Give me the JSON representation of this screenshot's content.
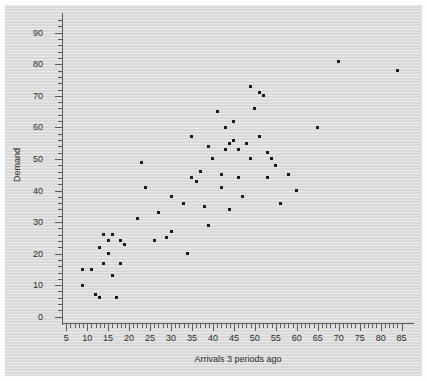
{
  "chart_data": {
    "type": "scatter",
    "title": "",
    "xlabel": "Arrivals 3 periods ago",
    "ylabel": "Demand",
    "xlim": [
      4,
      87
    ],
    "ylim": [
      -2,
      95
    ],
    "xticks": [
      5,
      10,
      15,
      20,
      25,
      30,
      35,
      40,
      45,
      50,
      55,
      60,
      65,
      70,
      75,
      80,
      85
    ],
    "yticks": [
      0,
      10,
      20,
      30,
      40,
      50,
      60,
      70,
      80,
      90
    ],
    "x_minor_tick_step": 1,
    "y_minor_tick_step": 2,
    "grid": false,
    "legend": null,
    "marker": "square",
    "marker_color": "#1a1a1a",
    "marker_size_px": 3,
    "background_color": "#d9d9d9",
    "axis_color": "#5a5a5a",
    "points": [
      {
        "x": 9,
        "y": 15
      },
      {
        "x": 9,
        "y": 10
      },
      {
        "x": 11,
        "y": 15
      },
      {
        "x": 12,
        "y": 7
      },
      {
        "x": 13,
        "y": 6
      },
      {
        "x": 13,
        "y": 22
      },
      {
        "x": 14,
        "y": 17
      },
      {
        "x": 14,
        "y": 26
      },
      {
        "x": 15,
        "y": 20
      },
      {
        "x": 15,
        "y": 24
      },
      {
        "x": 16,
        "y": 26
      },
      {
        "x": 16,
        "y": 13
      },
      {
        "x": 17,
        "y": 6
      },
      {
        "x": 18,
        "y": 24
      },
      {
        "x": 18,
        "y": 17
      },
      {
        "x": 19,
        "y": 23
      },
      {
        "x": 22,
        "y": 31
      },
      {
        "x": 23,
        "y": 49
      },
      {
        "x": 24,
        "y": 41
      },
      {
        "x": 26,
        "y": 24
      },
      {
        "x": 27,
        "y": 33
      },
      {
        "x": 29,
        "y": 25
      },
      {
        "x": 30,
        "y": 27
      },
      {
        "x": 30,
        "y": 38
      },
      {
        "x": 33,
        "y": 36
      },
      {
        "x": 34,
        "y": 20
      },
      {
        "x": 35,
        "y": 57
      },
      {
        "x": 35,
        "y": 44
      },
      {
        "x": 36,
        "y": 43
      },
      {
        "x": 37,
        "y": 46
      },
      {
        "x": 38,
        "y": 35
      },
      {
        "x": 39,
        "y": 54
      },
      {
        "x": 39,
        "y": 29
      },
      {
        "x": 40,
        "y": 50
      },
      {
        "x": 41,
        "y": 65
      },
      {
        "x": 42,
        "y": 41
      },
      {
        "x": 42,
        "y": 45
      },
      {
        "x": 43,
        "y": 53
      },
      {
        "x": 43,
        "y": 60
      },
      {
        "x": 44,
        "y": 55
      },
      {
        "x": 44,
        "y": 34
      },
      {
        "x": 45,
        "y": 56
      },
      {
        "x": 45,
        "y": 62
      },
      {
        "x": 46,
        "y": 44
      },
      {
        "x": 46,
        "y": 53
      },
      {
        "x": 47,
        "y": 38
      },
      {
        "x": 48,
        "y": 55
      },
      {
        "x": 49,
        "y": 50
      },
      {
        "x": 49,
        "y": 73
      },
      {
        "x": 50,
        "y": 66
      },
      {
        "x": 51,
        "y": 57
      },
      {
        "x": 51,
        "y": 71
      },
      {
        "x": 52,
        "y": 70
      },
      {
        "x": 53,
        "y": 44
      },
      {
        "x": 53,
        "y": 52
      },
      {
        "x": 54,
        "y": 50
      },
      {
        "x": 55,
        "y": 48
      },
      {
        "x": 56,
        "y": 36
      },
      {
        "x": 58,
        "y": 45
      },
      {
        "x": 60,
        "y": 40
      },
      {
        "x": 65,
        "y": 60
      },
      {
        "x": 70,
        "y": 81
      },
      {
        "x": 84,
        "y": 78
      }
    ]
  }
}
